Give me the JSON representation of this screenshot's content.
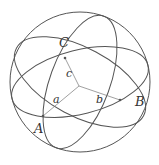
{
  "diagram": {
    "colors": {
      "line": "#555555",
      "inner": "#777777",
      "text": "#333333",
      "background": "#ffffff"
    },
    "sphere": {
      "cx": 80,
      "cy": 82,
      "r": 70
    },
    "great_circles": [
      {
        "id": "gc-1",
        "cx": 80,
        "cy": 82,
        "rx": 70,
        "ry": 32,
        "rotate": -14
      },
      {
        "id": "gc-2",
        "cx": 80,
        "cy": 82,
        "rx": 72,
        "ry": 34,
        "rotate": 28
      },
      {
        "id": "gc-3",
        "cx": 80,
        "cy": 82,
        "rx": 70,
        "ry": 30,
        "rotate": 110
      }
    ],
    "center": {
      "x": 79,
      "y": 86
    },
    "vertices": [
      {
        "name": "A",
        "x": 43,
        "y": 116,
        "label_x": 34,
        "label_y": 133
      },
      {
        "name": "B",
        "x": 120,
        "y": 100,
        "label_x": 135,
        "label_y": 106
      },
      {
        "name": "C",
        "x": 65,
        "y": 58,
        "label_x": 59,
        "label_y": 47
      }
    ],
    "edge_labels": [
      {
        "name": "a",
        "x": 53,
        "y": 103
      },
      {
        "name": "b",
        "x": 96,
        "y": 103
      },
      {
        "name": "c",
        "x": 66,
        "y": 77
      }
    ]
  }
}
